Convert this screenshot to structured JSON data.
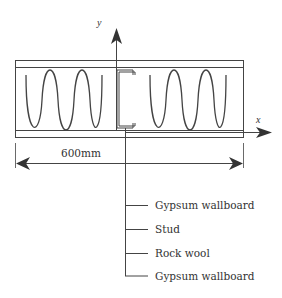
{
  "diagram": {
    "type": "wall-cross-section",
    "axes": {
      "y_label": "y",
      "x_label": "x"
    },
    "dimension": {
      "label": "600mm"
    },
    "components": [
      {
        "label": "Gypsum wallboard"
      },
      {
        "label": "Stud"
      },
      {
        "label": "Rock wool"
      },
      {
        "label": "Gypsum wallboard"
      }
    ],
    "colors": {
      "line": "#444444",
      "background": "#ffffff",
      "text": "#333333"
    }
  }
}
